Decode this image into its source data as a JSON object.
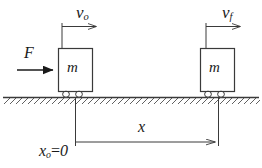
{
  "figure": {
    "ink_color": "#3a3a3a",
    "text_color": "#1a1a1a",
    "background": "#ffffff"
  },
  "labels": {
    "v_initial": {
      "symbol": "v",
      "subscript": "o"
    },
    "v_final": {
      "symbol": "v",
      "subscript": "f"
    },
    "force": "F",
    "mass_left": "m",
    "mass_right": "m",
    "displacement": "x",
    "origin": {
      "symbol": "x",
      "subscript": "o",
      "equals": "=",
      "value": "0"
    }
  },
  "diagram_data": {
    "type": "physics-free-body",
    "ground_line_y": 97,
    "blocks": [
      {
        "name": "block-initial",
        "x": 58,
        "y": 48,
        "width": 34,
        "height": 44,
        "label": "m",
        "wheels": 2
      },
      {
        "name": "block-final",
        "x": 200,
        "y": 48,
        "width": 34,
        "height": 44,
        "label": "m",
        "wheels": 2
      }
    ],
    "vectors": [
      {
        "name": "velocity-initial",
        "label": "v_o",
        "from_x": 62,
        "to_x": 102,
        "y": 26,
        "style": "thin-arrow"
      },
      {
        "name": "velocity-final",
        "label": "v_f",
        "from_x": 204,
        "to_x": 244,
        "y": 26,
        "style": "thin-arrow"
      },
      {
        "name": "applied-force",
        "label": "F",
        "from_x": 17,
        "to_x": 58,
        "y": 70,
        "style": "thick-arrow"
      }
    ],
    "dimension": {
      "name": "displacement-x",
      "label": "x",
      "from_x": 75,
      "to_x": 218,
      "y": 142,
      "origin_label": "x_o=0"
    }
  }
}
